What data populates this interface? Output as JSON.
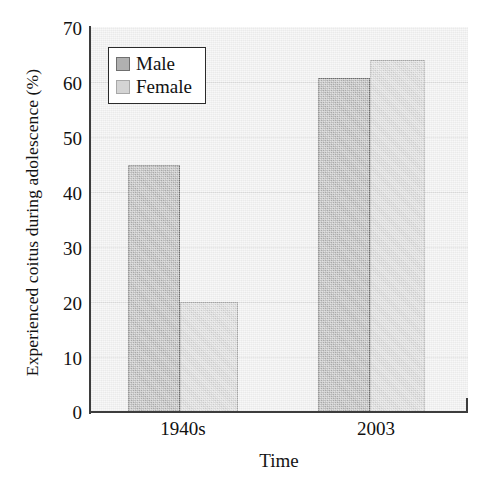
{
  "chart_data": {
    "type": "bar",
    "title": "",
    "xlabel": "Time",
    "ylabel": "Experienced coitus during adolescence (%)",
    "categories": [
      "1940s",
      "2003"
    ],
    "series": [
      {
        "name": "Male",
        "values": [
          45,
          60.7
        ],
        "color": "#b3b3b3"
      },
      {
        "name": "Female",
        "values": [
          20,
          64
        ],
        "color": "#d6d6d6"
      }
    ],
    "ylim": [
      0,
      70
    ],
    "ytick_labels": [
      "0",
      "10",
      "20",
      "30",
      "40",
      "50",
      "60",
      "70"
    ],
    "ytick_values": [
      0,
      10,
      20,
      30,
      40,
      50,
      60,
      70
    ],
    "grid": true,
    "legend_position": "upper-left-inside",
    "plot_background": "#efefef",
    "axis_color": "#3d3d3d",
    "gridline_color": "#dcdcdc"
  },
  "legend": {
    "entries": [
      {
        "label": "Male",
        "swatch": "#b3b3b3"
      },
      {
        "label": "Female",
        "swatch": "#d6d6d6"
      }
    ]
  },
  "axes": {
    "y_title": "Experienced coitus during adolescence (%)",
    "x_title": "Time",
    "y_ticks": [
      "70",
      "60",
      "50",
      "40",
      "30",
      "20",
      "10",
      "0"
    ],
    "x_ticks": [
      "1940s",
      "2003"
    ]
  }
}
